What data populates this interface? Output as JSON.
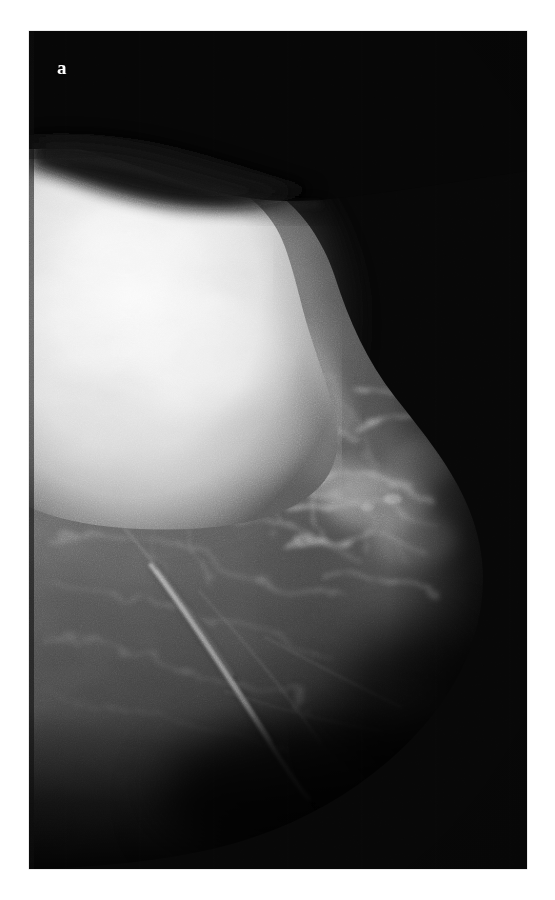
{
  "figure": {
    "panel_label": "a",
    "modality": "mammogram",
    "view": "mediolateral-oblique"
  },
  "frame": {
    "x": 29,
    "y": 31,
    "width": 498,
    "height": 838,
    "background_color": "#050505",
    "border_color": "#d8d8d8"
  },
  "page": {
    "background_color": "#ffffff",
    "width": 555,
    "height": 900
  },
  "palette": {
    "air_black": "#060606",
    "deep_shadow": "#121212",
    "dark_tissue": "#2b2b2b",
    "mid_tissue": "#565656",
    "light_tissue": "#8d8d8d",
    "bright_stroma": "#c8c8c8",
    "dense_mass": "#f2f2f2",
    "label_white": "#fdfdfd"
  },
  "regions": [
    {
      "name": "background-air",
      "description": "Uniform near-black exposure field filling the upper-right two thirds of the radiograph",
      "brightness": "#060606"
    },
    {
      "name": "skin-air-band",
      "description": "Dark wedge-shaped band of air lying above the superior breast border near the top-left",
      "brightness": "#101010"
    },
    {
      "name": "dense-mass",
      "description": "Large markedly radiodense, well-circumscribed high-attenuation region occupying the upper-left quadrant",
      "brightness": "#f2f2f2"
    },
    {
      "name": "fibroglandular-tissue",
      "description": "Mid-gray parenchyma with streaky interlacing fibrous strands filling the central and lower breast",
      "brightness": "#565656"
    },
    {
      "name": "stromal-strands",
      "description": "Bright curvilinear Cooper ligament and vascular strands radiating through the central-right parenchyma",
      "brightness": "#c8c8c8"
    },
    {
      "name": "linear-vessel",
      "description": "Prominent bright linear density coursing inferolaterally through the lower breast",
      "brightness": "#b4b4b4"
    },
    {
      "name": "posterior-fat-edge",
      "description": "Gradual darkening at the posterior inferior margin where the breast contour fades into the exposure field",
      "brightness": "#1a1a1a"
    },
    {
      "name": "corner-artifact",
      "description": "Very faint rounded detector artifact visible in the upper-right corner of the exposure field",
      "brightness": "#131313"
    }
  ]
}
